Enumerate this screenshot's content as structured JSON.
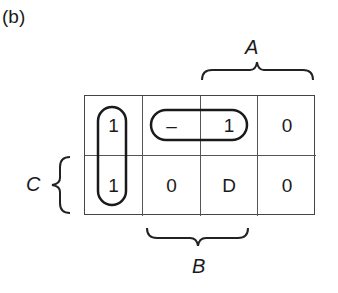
{
  "panel_label": "(b)",
  "variables": {
    "A": "A",
    "B": "B",
    "C": "C"
  },
  "kmap": {
    "rows": [
      [
        "1",
        "–",
        "1",
        "0"
      ],
      [
        "1",
        "0",
        "D",
        "0"
      ]
    ]
  },
  "groupings": [
    {
      "name": "vertical-loop",
      "cells": [
        [
          0,
          0
        ],
        [
          1,
          0
        ]
      ]
    },
    {
      "name": "horizontal-loop",
      "cells": [
        [
          0,
          1
        ],
        [
          0,
          2
        ]
      ]
    }
  ]
}
